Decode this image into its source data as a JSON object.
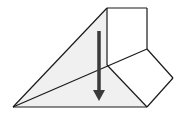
{
  "diagram": {
    "title": "Fold diagram: flap folded down",
    "colors": {
      "stroke": "#1a1a1a",
      "triangle_fill": "#f0f0f0",
      "flap_fill": "#ffffff",
      "arrow": "#3a3a3a"
    },
    "points": {
      "left_tip": [
        13,
        107
      ],
      "bottom_right": [
        147,
        107
      ],
      "top_left": [
        107,
        8
      ],
      "top_right": [
        147,
        8
      ],
      "square_bottom_right": [
        147,
        49
      ],
      "center": [
        107,
        65
      ],
      "right_point": [
        173,
        78
      ]
    },
    "arrow": {
      "direction": "down",
      "x": 99,
      "y_start": 31,
      "y_end": 101
    }
  }
}
